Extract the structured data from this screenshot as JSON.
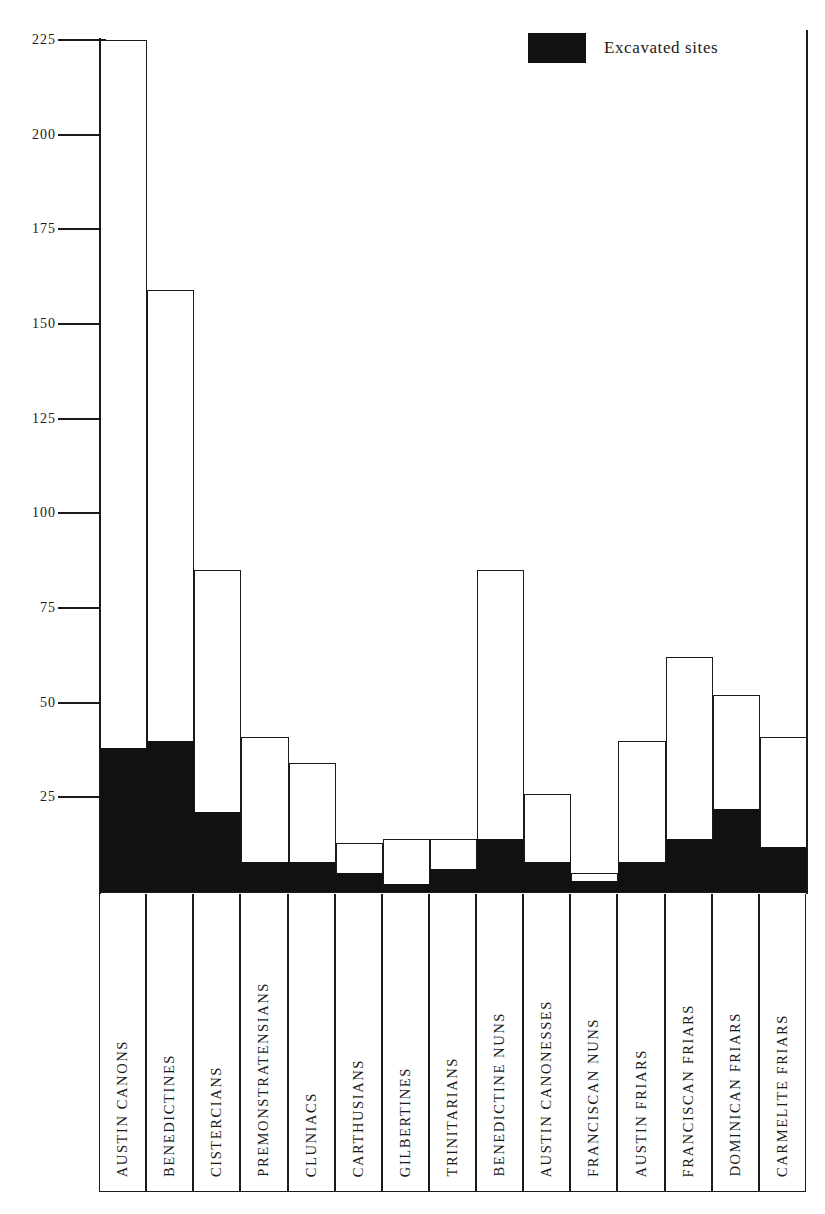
{
  "legend": {
    "label": "Excavated sites",
    "swatch_color": "#111111"
  },
  "axis": {
    "tick_labels": [
      "225",
      "200",
      "175",
      "150",
      "125",
      "100",
      "75",
      "50",
      "25"
    ],
    "tick_values": [
      225,
      200,
      175,
      150,
      125,
      100,
      75,
      50,
      25
    ]
  },
  "chart_data": {
    "type": "bar",
    "title": "",
    "subtitle": "",
    "xlabel": "",
    "ylabel": "",
    "ylim": [
      0,
      225
    ],
    "grid": false,
    "legend_position": "top-right",
    "stacked": true,
    "categories": [
      "AUSTIN CANONS",
      "BENEDICTINES",
      "CISTERCIANS",
      "PREMONSTRATENSIANS",
      "CLUNIACS",
      "CARTHUSIANS",
      "GILBERTINES",
      "TRINITARIANS",
      "BENEDICTINE NUNS",
      "AUSTIN CANONESSES",
      "FRANCISCAN NUNS",
      "AUSTIN FRIARS",
      "FRANCISCAN FRIARS",
      "DOMINICAN FRIARS",
      "CARMELITE FRIARS"
    ],
    "series": [
      {
        "name": "Total sites",
        "values": [
          225,
          159,
          85,
          41,
          34,
          13,
          14,
          14,
          85,
          26,
          5,
          40,
          62,
          52,
          41
        ]
      },
      {
        "name": "Excavated sites",
        "values": [
          38,
          40,
          21,
          8,
          8,
          5,
          2,
          6,
          14,
          8,
          3,
          8,
          14,
          22,
          12
        ]
      }
    ],
    "ticks": [
      225,
      200,
      175,
      150,
      125,
      100,
      75,
      50,
      25
    ]
  }
}
